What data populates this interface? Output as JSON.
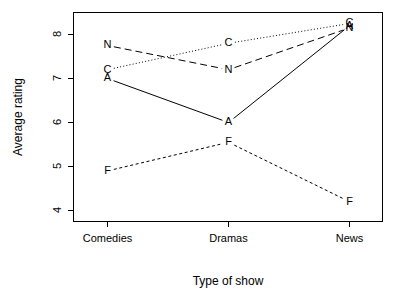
{
  "chart_data": {
    "type": "line",
    "title": "",
    "subtitle": "",
    "xlabel": "Type of show",
    "ylabel": "Average rating",
    "categories": [
      "Comedies",
      "Dramas",
      "News"
    ],
    "xtick_labels": [
      "Comedies",
      "Dramas",
      "News"
    ],
    "ytick_labels": [
      "4",
      "5",
      "6",
      "7",
      "8"
    ],
    "ytick_values": [
      4,
      5,
      6,
      7,
      8
    ],
    "ylim": [
      3.6,
      8.55
    ],
    "grid": false,
    "legend": "none (series identified by point letters)",
    "annotations": "Interaction plot; each series is marked by its letter at every category",
    "series": [
      {
        "name": "A",
        "label": "A",
        "linestyle": "solid",
        "color": "#000000",
        "values": [
          7.0,
          6.0,
          8.2
        ]
      },
      {
        "name": "C",
        "label": "C",
        "linestyle": "dotted",
        "color": "#000000",
        "values": [
          7.2,
          7.8,
          8.25
        ]
      },
      {
        "name": "F",
        "label": "F",
        "linestyle": "dashed",
        "color": "#000000",
        "values": [
          4.9,
          5.55,
          4.2
        ]
      },
      {
        "name": "N",
        "label": "N",
        "linestyle": "longdash",
        "color": "#000000",
        "values": [
          7.75,
          7.2,
          8.15
        ]
      }
    ]
  },
  "figure": {
    "background_color": "#ffffff",
    "foreground_color": "#000000"
  }
}
